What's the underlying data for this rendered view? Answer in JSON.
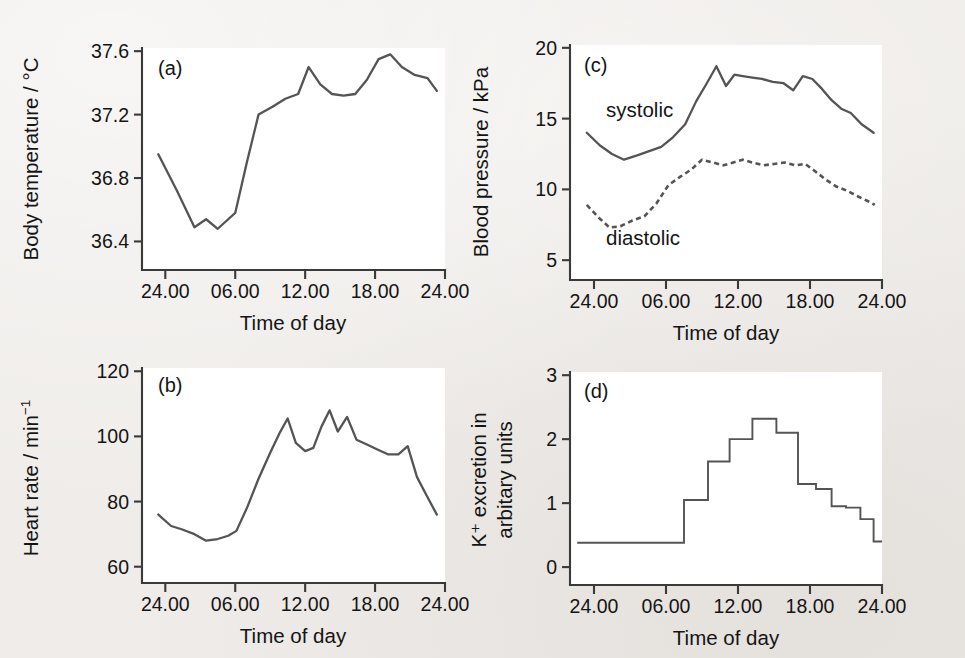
{
  "figure": {
    "background_color": "#efece9",
    "plot_background_color": "#ffffff",
    "line_color": "#555353",
    "axis_color": "#3a3a3a",
    "text_color": "#141414"
  },
  "panels": {
    "a": {
      "letter": "(a)",
      "xlabel": "Time of day",
      "ylabel_prefix": "Body temperature / ",
      "ylabel_unit": "°C"
    },
    "b": {
      "letter": "(b)",
      "xlabel": "Time of day",
      "ylabel_prefix": "Heart rate / min",
      "ylabel_sup": "−1"
    },
    "c": {
      "letter": "(c)",
      "xlabel": "Time of day",
      "ylabel": "Blood pressure / kPa",
      "series_label_systolic": "systolic",
      "series_label_diastolic": "diastolic"
    },
    "d": {
      "letter": "(d)",
      "xlabel": "Time of day",
      "ylabel_line1": "K⁺ excretion in",
      "ylabel_line2": "arbitary units"
    }
  },
  "chart_data": [
    {
      "id": "a",
      "type": "line",
      "title": "(a)",
      "xlabel": "Time of day",
      "ylabel": "Body temperature / °C",
      "xlim": [
        22,
        48
      ],
      "ylim": [
        36.22,
        37.62
      ],
      "xticks": [
        24,
        30,
        36,
        42,
        48
      ],
      "xticklabels": [
        "24.00",
        "06.00",
        "12.00",
        "18.00",
        "24.00"
      ],
      "yticks": [
        36.4,
        36.8,
        37.2,
        37.6
      ],
      "yticklabels": [
        "36.4",
        "36.8",
        "37.2",
        "37.6"
      ],
      "grid": false,
      "x": [
        23.4,
        25.0,
        26.5,
        27.5,
        28.5,
        29.4,
        30.0,
        31.0,
        32.0,
        33.2,
        34.3,
        35.4,
        36.3,
        37.3,
        38.3,
        39.3,
        40.3,
        41.3,
        42.3,
        43.3,
        44.3,
        45.4,
        46.5,
        47.3
      ],
      "values": [
        36.95,
        36.72,
        36.49,
        36.54,
        36.48,
        36.54,
        36.58,
        36.9,
        37.2,
        37.25,
        37.3,
        37.33,
        37.5,
        37.39,
        37.33,
        37.32,
        37.33,
        37.42,
        37.55,
        37.58,
        37.5,
        37.45,
        37.43,
        37.35
      ]
    },
    {
      "id": "b",
      "type": "line",
      "title": "(b)",
      "xlabel": "Time of day",
      "ylabel": "Heart rate / min−1",
      "xlim": [
        22,
        48
      ],
      "ylim": [
        55,
        121
      ],
      "xticks": [
        24,
        30,
        36,
        42,
        48
      ],
      "xticklabels": [
        "24.00",
        "06.00",
        "12.00",
        "18.00",
        "24.00"
      ],
      "yticks": [
        60,
        80,
        100,
        120
      ],
      "yticklabels": [
        "60",
        "80",
        "100",
        "120"
      ],
      "grid": false,
      "x": [
        23.4,
        24.5,
        25.4,
        26.5,
        27.5,
        28.5,
        29.4,
        30.1,
        31.0,
        32.0,
        33.0,
        33.8,
        34.5,
        35.2,
        36.0,
        36.7,
        37.4,
        38.1,
        38.8,
        39.6,
        40.4,
        41.3,
        42.2,
        43.1,
        44.0,
        44.8,
        45.6,
        46.4,
        47.3
      ],
      "values": [
        76,
        72.5,
        71.5,
        70,
        68,
        68.5,
        69.5,
        71,
        78,
        87,
        95,
        101,
        105.5,
        98,
        95.5,
        96.5,
        103,
        108,
        101.5,
        106,
        99,
        97.5,
        96,
        94.5,
        94.5,
        97,
        87.5,
        82,
        76
      ]
    },
    {
      "id": "c",
      "type": "line",
      "title": "(c)",
      "xlabel": "Time of day",
      "ylabel": "Blood pressure / kPa",
      "xlim": [
        22,
        48
      ],
      "ylim": [
        3.6,
        20.2
      ],
      "xticks": [
        24,
        30,
        36,
        42,
        48
      ],
      "xticklabels": [
        "24.00",
        "06.00",
        "12.00",
        "18.00",
        "24.00"
      ],
      "yticks": [
        5,
        10,
        15,
        20
      ],
      "yticklabels": [
        "5",
        "10",
        "15",
        "20"
      ],
      "grid": false,
      "annotations": [
        {
          "text": "systolic",
          "x": 25.0,
          "y": 15.1
        },
        {
          "text": "diastolic",
          "x": 25.0,
          "y": 6.1
        }
      ],
      "series": [
        {
          "name": "systolic",
          "style": "solid",
          "x": [
            23.4,
            24.5,
            25.5,
            26.5,
            27.6,
            28.6,
            29.6,
            30.6,
            31.6,
            32.5,
            33.4,
            34.2,
            35.0,
            35.7,
            36.4,
            37.2,
            38.0,
            38.9,
            39.8,
            40.6,
            41.4,
            42.2,
            43.0,
            43.8,
            44.6,
            45.4,
            46.3,
            47.3
          ],
          "values": [
            14.0,
            13.1,
            12.5,
            12.1,
            12.4,
            12.7,
            13.0,
            13.7,
            14.6,
            16.2,
            17.5,
            18.7,
            17.3,
            18.1,
            18.0,
            17.9,
            17.8,
            17.6,
            17.5,
            17.0,
            18.0,
            17.8,
            17.1,
            16.3,
            15.7,
            15.4,
            14.6,
            14.0
          ]
        },
        {
          "name": "diastolic",
          "style": "dashed",
          "x": [
            23.4,
            24.4,
            25.3,
            26.2,
            27.2,
            28.2,
            29.2,
            30.2,
            31.2,
            32.1,
            33.0,
            33.9,
            34.8,
            35.6,
            36.4,
            37.2,
            38.1,
            39.0,
            39.9,
            40.8,
            41.6,
            42.4,
            43.3,
            44.2,
            45.1,
            46.0,
            47.0,
            47.4
          ],
          "values": [
            8.9,
            8.0,
            7.3,
            7.4,
            7.8,
            8.1,
            9.0,
            10.3,
            10.9,
            11.4,
            12.1,
            11.9,
            11.7,
            11.9,
            12.1,
            11.9,
            11.7,
            11.8,
            11.9,
            11.7,
            11.8,
            11.3,
            10.7,
            10.2,
            9.9,
            9.5,
            9.1,
            8.9
          ]
        }
      ]
    },
    {
      "id": "d",
      "type": "bar",
      "subtype": "step",
      "title": "(d)",
      "xlabel": "Time of day",
      "ylabel": "K⁺ excretion in arbitary units",
      "xlim": [
        22,
        48
      ],
      "ylim": [
        -0.28,
        3.05
      ],
      "xticks": [
        24,
        30,
        36,
        42,
        48
      ],
      "xticklabels": [
        "24.00",
        "06.00",
        "12.00",
        "18.00",
        "24.00"
      ],
      "yticks": [
        0,
        1,
        2,
        3
      ],
      "yticklabels": [
        "0",
        "1",
        "2",
        "3"
      ],
      "grid": false,
      "step_edges": [
        22.6,
        31.5,
        33.5,
        35.3,
        37.2,
        39.2,
        41.0,
        42.5,
        43.8,
        45.0,
        46.2,
        47.3,
        48.0
      ],
      "values": [
        0.38,
        1.05,
        1.65,
        2.0,
        2.32,
        2.1,
        1.3,
        1.22,
        0.95,
        0.93,
        0.75,
        0.4
      ]
    }
  ]
}
